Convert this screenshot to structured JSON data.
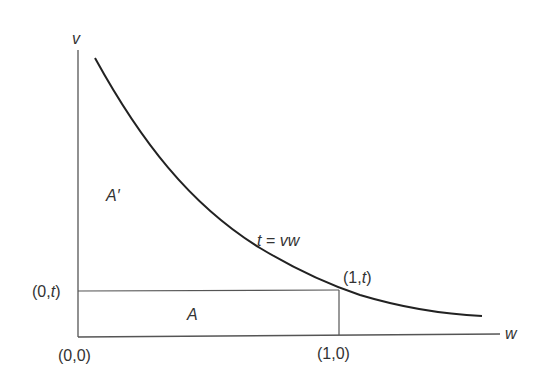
{
  "diagram": {
    "axes": {
      "y_label": "v",
      "x_label": "w"
    },
    "curve_label": {
      "t": "t",
      "eq": " = ",
      "rhs": "vw"
    },
    "regions": {
      "upper": "A′",
      "lower": "A"
    },
    "points": {
      "origin": "(0,0)",
      "zero_t_open": "(0,",
      "zero_t_var": "t",
      "zero_t_close": ")",
      "one_t_open": "(1,",
      "one_t_var": "t",
      "one_t_close": ")",
      "one_zero": "(1,0)"
    },
    "colors": {
      "line": "#444444",
      "curve": "#222222",
      "text": "#333333"
    }
  }
}
